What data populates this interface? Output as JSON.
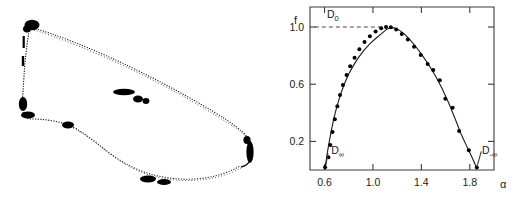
{
  "figure": {
    "background_color": "#ffffff",
    "ink_color": "#000000",
    "panels": [
      {
        "id": "attractor",
        "name": "strange-attractor-orbit",
        "type": "scatter-orbit"
      },
      {
        "id": "spectrum",
        "name": "multifractal-spectrum",
        "type": "scatter"
      }
    ]
  },
  "attractor": {
    "description": "closed quasi-periodic attractor orbit drawn as a dense dotted loop with darker clustered segments",
    "stroke_color": "#101010",
    "dense_segment_color": "#000000",
    "point_count_hint": "high-density dotted trace"
  },
  "chart_data": {
    "type": "scatter",
    "title": "",
    "xlabel": "α",
    "ylabel": "f",
    "xlim": [
      0.48,
      2.0
    ],
    "ylim": [
      0.0,
      1.14
    ],
    "xticks": [
      0.6,
      1.0,
      1.4,
      1.8
    ],
    "xticklabels": [
      "0.6",
      "1.0",
      "1.4",
      "1.8"
    ],
    "yticks": [
      0.2,
      0.6,
      1.0
    ],
    "yticklabels": [
      "0.2",
      "0.6",
      "1.0"
    ],
    "grid": false,
    "legend": null,
    "frame": "box",
    "tick_direction": "in",
    "annotations": [
      {
        "name": "d-zero",
        "text": "D",
        "sub": "0",
        "x": 0.62,
        "y": 1.06
      },
      {
        "name": "d-plus-infinity",
        "text": "D",
        "sub": "∞",
        "x": 0.655,
        "y": 0.11
      },
      {
        "name": "d-minus-infinity",
        "text": "D",
        "sub": "-∞",
        "x": 1.9,
        "y": 0.11
      }
    ],
    "reference_lines": [
      {
        "name": "d-zero-dashed",
        "orientation": "horizontal",
        "y": 1.0,
        "x_from": 0.52,
        "x_to": 1.12,
        "style": "dashed"
      }
    ],
    "series": [
      {
        "name": "f(alpha) data points",
        "marker": "filled-circle",
        "color": "#000000",
        "points": [
          [
            0.605,
            0.02
          ],
          [
            0.632,
            0.09
          ],
          [
            0.648,
            0.175
          ],
          [
            0.666,
            0.265
          ],
          [
            0.685,
            0.355
          ],
          [
            0.706,
            0.445
          ],
          [
            0.728,
            0.525
          ],
          [
            0.752,
            0.595
          ],
          [
            0.782,
            0.665
          ],
          [
            0.812,
            0.725
          ],
          [
            0.848,
            0.785
          ],
          [
            0.888,
            0.845
          ],
          [
            0.93,
            0.895
          ],
          [
            0.975,
            0.935
          ],
          [
            1.022,
            0.968
          ],
          [
            1.068,
            0.992
          ],
          [
            1.108,
            1.0
          ],
          [
            1.148,
            0.998
          ],
          [
            1.192,
            0.982
          ],
          [
            1.238,
            0.952
          ],
          [
            1.288,
            0.912
          ],
          [
            1.34,
            0.862
          ],
          [
            1.395,
            0.805
          ],
          [
            1.452,
            0.742
          ],
          [
            1.498,
            0.7
          ],
          [
            1.552,
            0.628
          ],
          [
            1.598,
            0.498
          ],
          [
            1.658,
            0.435
          ],
          [
            1.712,
            0.272
          ],
          [
            1.792,
            0.138
          ],
          [
            1.858,
            0.018
          ]
        ]
      }
    ],
    "fit_curve": {
      "name": "smooth f(alpha) fit",
      "points": [
        [
          0.602,
          0.005
        ],
        [
          0.615,
          0.075
        ],
        [
          0.632,
          0.165
        ],
        [
          0.652,
          0.258
        ],
        [
          0.674,
          0.348
        ],
        [
          0.7,
          0.438
        ],
        [
          0.73,
          0.522
        ],
        [
          0.762,
          0.598
        ],
        [
          0.798,
          0.668
        ],
        [
          0.838,
          0.73
        ],
        [
          0.88,
          0.786
        ],
        [
          0.925,
          0.836
        ],
        [
          0.972,
          0.88
        ],
        [
          1.02,
          0.918
        ],
        [
          1.068,
          0.952
        ],
        [
          1.108,
          0.98
        ],
        [
          1.14,
          0.994
        ],
        [
          1.175,
          0.995
        ],
        [
          1.215,
          0.98
        ],
        [
          1.258,
          0.952
        ],
        [
          1.305,
          0.912
        ],
        [
          1.355,
          0.862
        ],
        [
          1.408,
          0.802
        ],
        [
          1.462,
          0.734
        ],
        [
          1.518,
          0.656
        ],
        [
          1.572,
          0.568
        ],
        [
          1.625,
          0.47
        ],
        [
          1.678,
          0.36
        ],
        [
          1.728,
          0.252
        ],
        [
          1.778,
          0.16
        ],
        [
          1.82,
          0.085
        ],
        [
          1.852,
          0.025
        ],
        [
          1.862,
          0.005
        ]
      ]
    }
  }
}
